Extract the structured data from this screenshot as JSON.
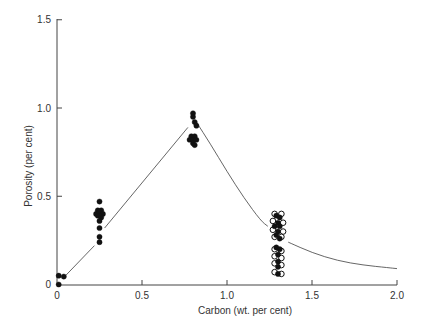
{
  "chart_data": {
    "type": "scatter",
    "title": "",
    "xlabel": "Carbon (wt. per cent)",
    "ylabel": "Porosity (per cent)",
    "xlim": [
      0,
      2.0
    ],
    "ylim": [
      0,
      1.5
    ],
    "xticks": [
      0,
      0.5,
      1.0,
      1.5,
      2.0
    ],
    "xtick_labels": [
      "0",
      "0.5",
      "1.0",
      "1.5",
      "2.0"
    ],
    "yticks": [
      0,
      0.5,
      1.0,
      1.5
    ],
    "ytick_labels": [
      "0",
      "0.5",
      "1.0",
      "1.5"
    ],
    "grid": false,
    "legend": null,
    "series": [
      {
        "name": "filled",
        "marker": "filled-circle",
        "points": [
          [
            0.01,
            0.05
          ],
          [
            0.04,
            0.045
          ],
          [
            0.01,
            0.0
          ],
          [
            0.25,
            0.47
          ],
          [
            0.24,
            0.42
          ],
          [
            0.26,
            0.42
          ],
          [
            0.23,
            0.4
          ],
          [
            0.25,
            0.41
          ],
          [
            0.27,
            0.4
          ],
          [
            0.24,
            0.39
          ],
          [
            0.26,
            0.38
          ],
          [
            0.25,
            0.36
          ],
          [
            0.25,
            0.32
          ],
          [
            0.25,
            0.27
          ],
          [
            0.25,
            0.24
          ],
          [
            0.8,
            0.97
          ],
          [
            0.8,
            0.95
          ],
          [
            0.81,
            0.92
          ],
          [
            0.82,
            0.9
          ],
          [
            0.79,
            0.84
          ],
          [
            0.81,
            0.84
          ],
          [
            0.78,
            0.82
          ],
          [
            0.8,
            0.82
          ],
          [
            0.82,
            0.82
          ],
          [
            0.8,
            0.8
          ],
          [
            0.81,
            0.79
          ],
          [
            1.29,
            0.39
          ],
          [
            1.31,
            0.38
          ],
          [
            1.3,
            0.35
          ],
          [
            1.28,
            0.33
          ],
          [
            1.31,
            0.33
          ],
          [
            1.3,
            0.3
          ],
          [
            1.29,
            0.28
          ],
          [
            1.31,
            0.26
          ],
          [
            1.29,
            0.21
          ],
          [
            1.31,
            0.2
          ],
          [
            1.3,
            0.17
          ],
          [
            1.3,
            0.13
          ],
          [
            1.3,
            0.1
          ],
          [
            1.3,
            0.06
          ]
        ]
      },
      {
        "name": "open",
        "marker": "open-circle",
        "points": [
          [
            1.28,
            0.4
          ],
          [
            1.32,
            0.4
          ],
          [
            1.27,
            0.36
          ],
          [
            1.33,
            0.35
          ],
          [
            1.27,
            0.31
          ],
          [
            1.33,
            0.3
          ],
          [
            1.28,
            0.27
          ],
          [
            1.32,
            0.27
          ],
          [
            1.28,
            0.2
          ],
          [
            1.32,
            0.19
          ],
          [
            1.28,
            0.16
          ],
          [
            1.32,
            0.15
          ],
          [
            1.28,
            0.12
          ],
          [
            1.32,
            0.11
          ],
          [
            1.28,
            0.07
          ],
          [
            1.32,
            0.06
          ]
        ]
      }
    ],
    "curves": [
      {
        "name": "rising-segment-1",
        "points": [
          [
            0.05,
            0.05
          ],
          [
            0.22,
            0.22
          ]
        ]
      },
      {
        "name": "rising-segment-2",
        "points": [
          [
            0.28,
            0.32
          ],
          [
            0.77,
            0.89
          ]
        ]
      },
      {
        "name": "falling-curve-1",
        "points": [
          [
            0.82,
            0.92
          ],
          [
            0.9,
            0.8
          ],
          [
            1.0,
            0.64
          ],
          [
            1.1,
            0.49
          ],
          [
            1.2,
            0.36
          ],
          [
            1.24,
            0.33
          ]
        ]
      },
      {
        "name": "falling-curve-2",
        "points": [
          [
            1.36,
            0.24
          ],
          [
            1.5,
            0.18
          ],
          [
            1.65,
            0.135
          ],
          [
            1.8,
            0.11
          ],
          [
            1.95,
            0.095
          ],
          [
            2.0,
            0.09
          ]
        ]
      }
    ],
    "colors": {
      "axis": "#444444",
      "marker": "#111111",
      "curve": "#555555",
      "background": "#ffffff"
    }
  }
}
